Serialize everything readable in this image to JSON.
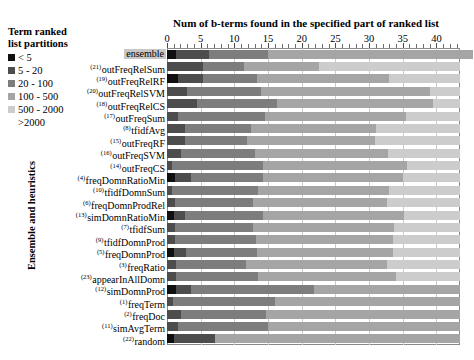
{
  "legend": {
    "title_line1": "Term ranked",
    "title_line2": "list partitions",
    "items": [
      {
        "label": "< 5",
        "color": "#101010",
        "swatch": true
      },
      {
        "label": "5 - 20",
        "color": "#4d4d4d",
        "swatch": true
      },
      {
        "label": "20 - 100",
        "color": "#7d7d7d",
        "swatch": true
      },
      {
        "label": "100 - 500",
        "color": "#a5a5a5",
        "swatch": true
      },
      {
        "label": "500 - 2000",
        "color": "#cccccc",
        "swatch": true
      },
      {
        "label": ">2000",
        "color": "#eeeeee",
        "swatch": false
      }
    ]
  },
  "axes": {
    "x_title": "Num of b-terms found in the specified part of ranked list",
    "y_title": "Ensemble and heuristics",
    "x_ticklabels": [
      "0",
      "5",
      "10",
      "15",
      "20",
      "25",
      "30",
      "35",
      "40"
    ],
    "x_tickvalues": [
      0,
      5,
      10,
      15,
      20,
      25,
      30,
      35,
      40
    ],
    "xlim": [
      0,
      43.5
    ]
  },
  "chart_data": {
    "type": "bar",
    "orientation": "horizontal",
    "stacked": true,
    "title": "Num of b-terms found in the specified part of ranked list",
    "xlabel": "Num of b-terms found in the specified part of ranked list",
    "ylabel": "Ensemble and heuristics",
    "xlim": [
      0,
      43.5
    ],
    "grid": true,
    "legend_position": "top-left-outside",
    "series": [
      {
        "name": "< 5",
        "color": "#101010"
      },
      {
        "name": "5 - 20",
        "color": "#4d4d4d"
      },
      {
        "name": "20 - 100",
        "color": "#7d7d7d"
      },
      {
        "name": "100 - 500",
        "color": "#a5a5a5"
      },
      {
        "name": "500 - 2000",
        "color": "#cccccc"
      },
      {
        "name": ">2000",
        "color": "#eeeeee"
      }
    ],
    "categories": [
      {
        "rank": "",
        "label": "ensemble",
        "highlight": true
      },
      {
        "rank": "(21)",
        "label": "outFreqRelSum",
        "highlight": false
      },
      {
        "rank": "(19)",
        "label": "outFreqRelRF",
        "highlight": false
      },
      {
        "rank": "(20)",
        "label": "outFreqRelSVM",
        "highlight": false
      },
      {
        "rank": "(18)",
        "label": "outFreqRelCS",
        "highlight": false
      },
      {
        "rank": "(17)",
        "label": "outFreqSum",
        "highlight": false
      },
      {
        "rank": "(8)",
        "label": "tfidfAvg",
        "highlight": false
      },
      {
        "rank": "(15)",
        "label": "outFreqRF",
        "highlight": false
      },
      {
        "rank": "(16)",
        "label": "outFreqSVM",
        "highlight": false
      },
      {
        "rank": "(14)",
        "label": "outFreqCS",
        "highlight": false
      },
      {
        "rank": "(4)",
        "label": "freqDomnRatioMin",
        "highlight": false
      },
      {
        "rank": "(10)",
        "label": "tfidfDomnSum",
        "highlight": false
      },
      {
        "rank": "(6)",
        "label": "freqDomnProdRel",
        "highlight": false
      },
      {
        "rank": "(13)",
        "label": "simDomnRatioMin",
        "highlight": false
      },
      {
        "rank": "(7)",
        "label": "tfidfSum",
        "highlight": false
      },
      {
        "rank": "(9)",
        "label": "tfidfDomnProd",
        "highlight": false
      },
      {
        "rank": "(5)",
        "label": "freqDomnProd",
        "highlight": false
      },
      {
        "rank": "(3)",
        "label": "freqRatio",
        "highlight": false
      },
      {
        "rank": "(23)",
        "label": "appearInAllDomn",
        "highlight": false
      },
      {
        "rank": "(12)",
        "label": "simDomnProd",
        "highlight": false
      },
      {
        "rank": "(1)",
        "label": "freqTerm",
        "highlight": false
      },
      {
        "rank": "(2)",
        "label": "freqDoc",
        "highlight": false
      },
      {
        "rank": "(11)",
        "label": "simAvgTerm",
        "highlight": false
      },
      {
        "rank": "(22)",
        "label": "random",
        "highlight": false
      }
    ],
    "values": [
      [
        1.3,
        4.9,
        8.8,
        30.5,
        0,
        0
      ],
      [
        0,
        5.3,
        6.2,
        11.0,
        21.0,
        0
      ],
      [
        1.6,
        3.8,
        8.0,
        19.5,
        10.6,
        0
      ],
      [
        0,
        2.9,
        11.0,
        25.2,
        4.4,
        0
      ],
      [
        0,
        4.5,
        11.9,
        23.1,
        4.0,
        0
      ],
      [
        0,
        1.7,
        12.9,
        20.9,
        8.0,
        0
      ],
      [
        0,
        2.6,
        9.8,
        18.6,
        12.5,
        0
      ],
      [
        0,
        2.6,
        9.3,
        19.0,
        12.6,
        0
      ],
      [
        0,
        2.1,
        11.0,
        19.7,
        10.7,
        0
      ],
      [
        0,
        0.8,
        13.5,
        21.4,
        7.8,
        0
      ],
      [
        1.2,
        2.3,
        10.8,
        20.8,
        8.4,
        0
      ],
      [
        0,
        0.8,
        12.7,
        19.4,
        10.6,
        0
      ],
      [
        0,
        1.2,
        11.5,
        19.9,
        10.9,
        0
      ],
      [
        1.0,
        1.6,
        11.6,
        21.0,
        8.3,
        0
      ],
      [
        0,
        1.2,
        11.6,
        20.9,
        9.8,
        0
      ],
      [
        0,
        1.2,
        12.0,
        20.3,
        10.0,
        0
      ],
      [
        1.0,
        1.8,
        10.6,
        20.2,
        9.9,
        0
      ],
      [
        0,
        1.3,
        10.5,
        20.9,
        10.8,
        0
      ],
      [
        0,
        1.4,
        12.1,
        20.5,
        9.5,
        0
      ],
      [
        1.4,
        2.2,
        18.3,
        21.6,
        0,
        0
      ],
      [
        0,
        0.9,
        15.2,
        27.4,
        0,
        0
      ],
      [
        0,
        2.1,
        12.6,
        28.8,
        0,
        0
      ],
      [
        0,
        1.7,
        13.3,
        28.5,
        0,
        0
      ],
      [
        1.1,
        6.0,
        0,
        36.4,
        0,
        0
      ]
    ]
  },
  "caption": {
    "text": ""
  }
}
